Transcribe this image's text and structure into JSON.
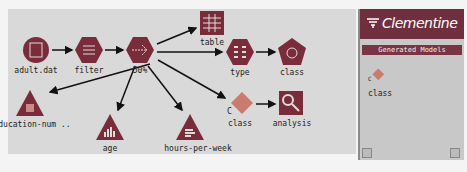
{
  "stream": {
    "nodes": [
      {
        "id": "adult",
        "label": "adult.dat",
        "shape": "circle",
        "icon": "file-source-icon",
        "x": 36,
        "y": 50
      },
      {
        "id": "filter",
        "label": "filter",
        "shape": "hexagon",
        "icon": "filter-icon",
        "x": 89,
        "y": 50
      },
      {
        "id": "sample",
        "label": "50%",
        "shape": "hexagon",
        "icon": "sample-icon",
        "x": 140,
        "y": 50
      },
      {
        "id": "table",
        "label": "table",
        "shape": "square",
        "icon": "table-icon",
        "x": 212,
        "y": 24
      },
      {
        "id": "type",
        "label": "type",
        "shape": "hexagon",
        "icon": "type-icon",
        "x": 240,
        "y": 52
      },
      {
        "id": "class1",
        "label": "class",
        "shape": "pentagon",
        "icon": "modeling-icon",
        "x": 292,
        "y": 52
      },
      {
        "id": "edu",
        "label": "education-num ..",
        "shape": "triangle",
        "icon": "histogram-icon",
        "x": 30,
        "y": 104
      },
      {
        "id": "age",
        "label": "age",
        "shape": "triangle",
        "icon": "histogram-icon",
        "x": 110,
        "y": 128
      },
      {
        "id": "hours",
        "label": "hours-per-week",
        "shape": "triangle",
        "icon": "histogram-icon",
        "x": 190,
        "y": 128
      },
      {
        "id": "class2",
        "label": "class",
        "shape": "diamond",
        "icon": "generated-model-icon",
        "x": 240,
        "y": 104
      },
      {
        "id": "analysis",
        "label": "analysis",
        "shape": "square",
        "icon": "analysis-icon",
        "x": 292,
        "y": 104
      }
    ]
  },
  "panel": {
    "brand": "Clementine",
    "section_title": "Generated Models",
    "models": [
      {
        "label": "class",
        "tag": "C"
      }
    ]
  },
  "colors": {
    "node": "#7a2c3a",
    "panel_header": "#6f2f3f",
    "canvas": "#d9d9d9"
  }
}
